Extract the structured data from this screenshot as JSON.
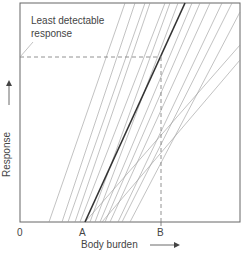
{
  "diagram": {
    "annotation": "Least detectable response",
    "annotation_line1": "Least detectable",
    "annotation_line2": "response",
    "y_axis_label": "Response",
    "x_axis_label": "Body burden",
    "x_ticks": [
      "0",
      "A",
      "B"
    ],
    "frame": {
      "left": 20,
      "top": 3,
      "right": 240,
      "bottom": 222
    },
    "threshold_y": 57,
    "b_x": 161,
    "thin_lines": [
      [
        49,
        222,
        125,
        3
      ],
      [
        62,
        222,
        135,
        3
      ],
      [
        68,
        222,
        145,
        3
      ],
      [
        75,
        222,
        150,
        3
      ],
      [
        80,
        222,
        165,
        3
      ],
      [
        90,
        222,
        170,
        3
      ],
      [
        95,
        222,
        178,
        3
      ],
      [
        100,
        222,
        192,
        3
      ],
      [
        105,
        222,
        200,
        3
      ],
      [
        110,
        222,
        210,
        3
      ],
      [
        118,
        222,
        222,
        3
      ],
      [
        122,
        222,
        232,
        3
      ],
      [
        130,
        222,
        240,
        12
      ],
      [
        102,
        222,
        240,
        60
      ],
      [
        85,
        222,
        240,
        45
      ]
    ],
    "thick_line": [
      85,
      222,
      185,
      3
    ]
  }
}
